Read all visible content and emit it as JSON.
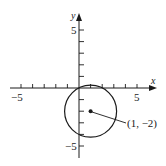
{
  "diagram": {
    "type": "circle-on-coordinate-plane",
    "axes": {
      "x_label": "x",
      "y_label": "y",
      "x_range": [
        -6,
        6
      ],
      "y_range": [
        -6,
        6
      ],
      "tick_step": 1,
      "x_tick_labels": [
        {
          "value": -5,
          "text": "−5"
        },
        {
          "value": 5,
          "text": "5"
        }
      ],
      "y_tick_labels": [
        {
          "value": 5,
          "text": "5"
        },
        {
          "value": -5,
          "text": "−5"
        }
      ]
    },
    "circle": {
      "center": [
        1,
        -2
      ],
      "radius_squared": 5,
      "passes_through_origin": true
    },
    "center_point": {
      "label": "(1, −2)"
    },
    "colors": {
      "stroke": "#1a1a1a",
      "background": "#ffffff"
    }
  }
}
